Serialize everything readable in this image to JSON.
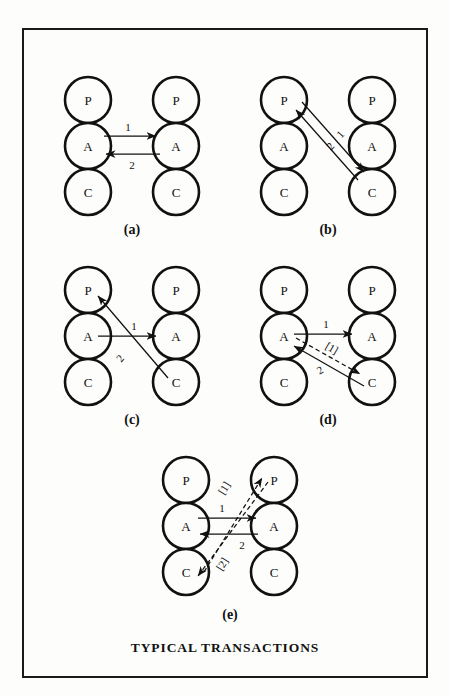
{
  "figure": {
    "caption": "TYPICAL TRANSACTIONS",
    "ego_states": {
      "parent": "P",
      "adult": "A",
      "child": "C"
    }
  },
  "panels": [
    {
      "id": "a",
      "caption": "(a)",
      "left_stack": [
        "P",
        "A",
        "C"
      ],
      "right_stack": [
        "P",
        "A",
        "C"
      ],
      "arrows": [
        {
          "label": "1",
          "from": "left-A",
          "to": "right-A",
          "style": "solid"
        },
        {
          "label": "2",
          "from": "right-A",
          "to": "left-A",
          "style": "solid"
        }
      ]
    },
    {
      "id": "b",
      "caption": "(b)",
      "left_stack": [
        "P",
        "A",
        "C"
      ],
      "right_stack": [
        "P",
        "A",
        "C"
      ],
      "arrows": [
        {
          "label": "1",
          "from": "left-P",
          "to": "right-C",
          "style": "solid"
        },
        {
          "label": "2",
          "from": "right-C",
          "to": "left-P",
          "style": "solid"
        }
      ]
    },
    {
      "id": "c",
      "caption": "(c)",
      "left_stack": [
        "P",
        "A",
        "C"
      ],
      "right_stack": [
        "P",
        "A",
        "C"
      ],
      "arrows": [
        {
          "label": "1",
          "from": "left-A",
          "to": "right-A",
          "style": "solid"
        },
        {
          "label": "2",
          "from": "right-C",
          "to": "left-P",
          "style": "solid"
        }
      ]
    },
    {
      "id": "d",
      "caption": "(d)",
      "left_stack": [
        "P",
        "A",
        "C"
      ],
      "right_stack": [
        "P",
        "A",
        "C"
      ],
      "arrows": [
        {
          "label": "1",
          "from": "left-A",
          "to": "right-A",
          "style": "solid"
        },
        {
          "label": "[1]",
          "from": "left-A",
          "to": "right-C",
          "style": "dashed"
        },
        {
          "label": "2",
          "from": "right-C",
          "to": "left-A",
          "style": "solid"
        }
      ]
    },
    {
      "id": "e",
      "caption": "(e)",
      "left_stack": [
        "P",
        "A",
        "C"
      ],
      "right_stack": [
        "P",
        "A",
        "C"
      ],
      "arrows": [
        {
          "label": "1",
          "from": "left-A",
          "to": "right-A",
          "style": "solid"
        },
        {
          "label": "2",
          "from": "right-A",
          "to": "left-A",
          "style": "solid"
        },
        {
          "label": "[1]",
          "from": "left-C",
          "to": "right-P",
          "style": "dashed"
        },
        {
          "label": "[2]",
          "from": "right-P",
          "to": "left-C",
          "style": "dashed"
        }
      ]
    }
  ],
  "colors": {
    "ink": "#111111",
    "paper": "#fdfdfc",
    "frame": "#1a1a1a"
  }
}
